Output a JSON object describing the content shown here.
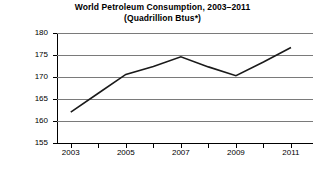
{
  "chart_data": {
    "type": "line",
    "title": "World Petroleum Consumption, 2003–2011",
    "subtitle": "(Quadrillion Btus*)",
    "xlabel": "",
    "ylabel": "Btus",
    "x": [
      2003,
      2004,
      2005,
      2006,
      2007,
      2008,
      2009,
      2010,
      2011
    ],
    "values": [
      162.0,
      166.3,
      170.6,
      172.4,
      174.6,
      172.3,
      170.3,
      173.4,
      176.7
    ],
    "categories": [
      "2003",
      "2004",
      "2005",
      "2006",
      "2007",
      "2008",
      "2009",
      "2010",
      "2011"
    ],
    "xtick_labels": [
      "2003",
      "2005",
      "2007",
      "2009",
      "2011"
    ],
    "xtick_values": [
      2003,
      2005,
      2007,
      2009,
      2011
    ],
    "xlim": [
      2002.5,
      2011.8
    ],
    "ylim": [
      155,
      180
    ],
    "ytick_labels": [
      "155",
      "160",
      "165",
      "170",
      "175",
      "180"
    ],
    "ytick_values": [
      155,
      160,
      165,
      170,
      175,
      180
    ],
    "grid": true,
    "legend": false,
    "series_color": "#1a1a1a",
    "grid_color": "#7a7a7a",
    "axis_color": "#000000"
  }
}
